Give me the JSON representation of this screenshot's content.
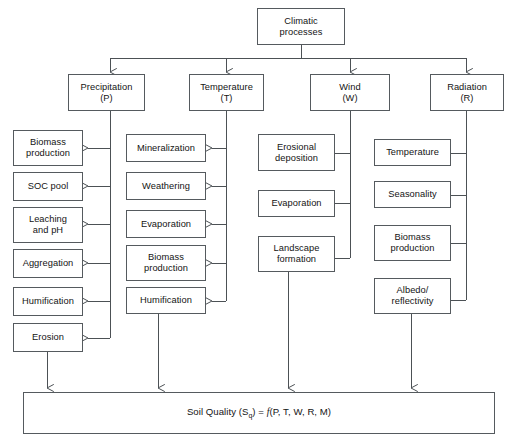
{
  "diagram": {
    "title_box": {
      "label": "Climatic\nprocesses"
    },
    "drivers": [
      {
        "id": "precipitation",
        "label": "Precipitation\n(P)"
      },
      {
        "id": "temperature",
        "label": "Temperature\n(T)"
      },
      {
        "id": "wind",
        "label": "Wind\n(W)"
      },
      {
        "id": "radiation",
        "label": "Radiation\n(R)"
      }
    ],
    "precipitation_effects": [
      {
        "id": "biomass-production",
        "label": "Biomass\nproduction"
      },
      {
        "id": "soc-pool",
        "label": "SOC pool"
      },
      {
        "id": "leaching-and-ph",
        "label": "Leaching\nand pH"
      },
      {
        "id": "aggregation",
        "label": "Aggregation"
      },
      {
        "id": "humification",
        "label": "Humification"
      },
      {
        "id": "erosion",
        "label": "Erosion"
      }
    ],
    "temperature_effects": [
      {
        "id": "mineralization",
        "label": "Mineralization"
      },
      {
        "id": "weathering",
        "label": "Weathering"
      },
      {
        "id": "evaporation",
        "label": "Evaporation"
      },
      {
        "id": "biomass-production",
        "label": "Biomass\nproduction"
      },
      {
        "id": "humification",
        "label": "Humification"
      }
    ],
    "wind_effects": [
      {
        "id": "erosional-deposition",
        "label": "Erosional\ndeposition"
      },
      {
        "id": "evaporation",
        "label": "Evaporation"
      },
      {
        "id": "landscape-formation",
        "label": "Landscape\nformation"
      }
    ],
    "radiation_effects": [
      {
        "id": "temperature",
        "label": "Temperature"
      },
      {
        "id": "seasonality",
        "label": "Seasonality"
      },
      {
        "id": "biomass-production",
        "label": "Biomass\nproduction"
      },
      {
        "id": "albedo-reflectivity",
        "label": "Albedo/\nreflectivity"
      }
    ],
    "result_box": {
      "prefix": "Soil Quality (S",
      "subscript": "q",
      "suffix": ") = ",
      "function_symbol": "f",
      "arguments": "(P, T, W, R, M)"
    },
    "colors": {
      "background": "#ffffff",
      "box_border": "#555a5e",
      "connector": "#4c5155",
      "text": "#141414"
    }
  }
}
